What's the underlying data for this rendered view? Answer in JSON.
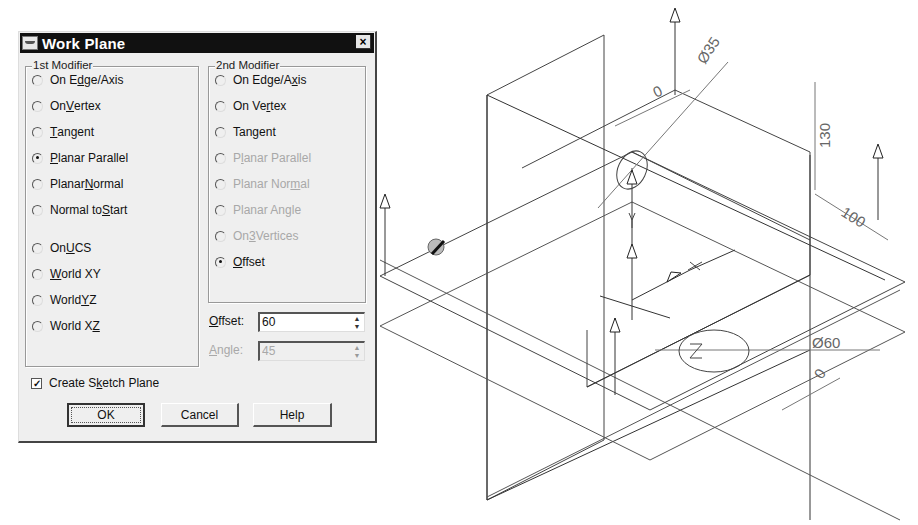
{
  "dialog": {
    "title": "Work Plane",
    "close_label": "×",
    "first_modifier": {
      "label": "1st Modifier",
      "options": [
        {
          "pre": "On E",
          "u": "d",
          "post": "ge/Axis",
          "checked": false,
          "disabled": false
        },
        {
          "pre": "On ",
          "u": "V",
          "post": "ertex",
          "checked": false,
          "disabled": false
        },
        {
          "pre": "",
          "u": "T",
          "post": "angent",
          "checked": false,
          "disabled": false
        },
        {
          "pre": "",
          "u": "P",
          "post": "lanar Parallel",
          "checked": true,
          "disabled": false
        },
        {
          "pre": "Planar ",
          "u": "N",
          "post": "ormal",
          "checked": false,
          "disabled": false
        },
        {
          "pre": "Normal to ",
          "u": "S",
          "post": "tart",
          "checked": false,
          "disabled": false
        },
        {
          "pre": "On ",
          "u": "U",
          "post": "CS",
          "checked": false,
          "disabled": false
        },
        {
          "pre": "",
          "u": "W",
          "post": "orld XY",
          "checked": false,
          "disabled": false
        },
        {
          "pre": "World ",
          "u": "Y",
          "post": "Z",
          "checked": false,
          "disabled": false
        },
        {
          "pre": "World X",
          "u": "Z",
          "post": "",
          "checked": false,
          "disabled": false
        }
      ]
    },
    "second_modifier": {
      "label": "2nd Modifier",
      "options": [
        {
          "pre": "On Edge/A",
          "u": "x",
          "post": "is",
          "checked": false,
          "disabled": false
        },
        {
          "pre": "On Ve",
          "u": "r",
          "post": "tex",
          "checked": false,
          "disabled": false
        },
        {
          "pre": "Tan",
          "u": "g",
          "post": "ent",
          "checked": false,
          "disabled": false
        },
        {
          "pre": "P",
          "u": "l",
          "post": "anar Parallel",
          "checked": false,
          "disabled": true
        },
        {
          "pre": "Planar Nor",
          "u": "m",
          "post": "al",
          "checked": false,
          "disabled": true
        },
        {
          "pre": "Planar Angle",
          "u": "",
          "post": "",
          "checked": false,
          "disabled": true
        },
        {
          "pre": "On ",
          "u": "3",
          "post": " Vertices",
          "checked": false,
          "disabled": true
        },
        {
          "pre": "",
          "u": "O",
          "post": "ffset",
          "checked": true,
          "disabled": false
        }
      ]
    },
    "offset": {
      "label_u": "O",
      "label_rest": "ffset:",
      "value": "60",
      "disabled": false
    },
    "angle": {
      "label_u": "A",
      "label_rest": "ngle:",
      "value": "45",
      "disabled": true
    },
    "create_sketch_plane": {
      "pre": "Create S",
      "u": "k",
      "post": "etch Plane",
      "checked": true
    },
    "buttons": {
      "ok": "OK",
      "cancel": "Cancel",
      "help": "Help"
    }
  },
  "drawing": {
    "dimensions": {
      "dia_top": "Ø35",
      "zero_top": "0",
      "height": "130",
      "depth": "100",
      "dia_bottom": "Ø60",
      "zero_bottom": "0"
    },
    "axis_labels": {
      "y": "Y",
      "z": "Z",
      "x": "X"
    }
  }
}
